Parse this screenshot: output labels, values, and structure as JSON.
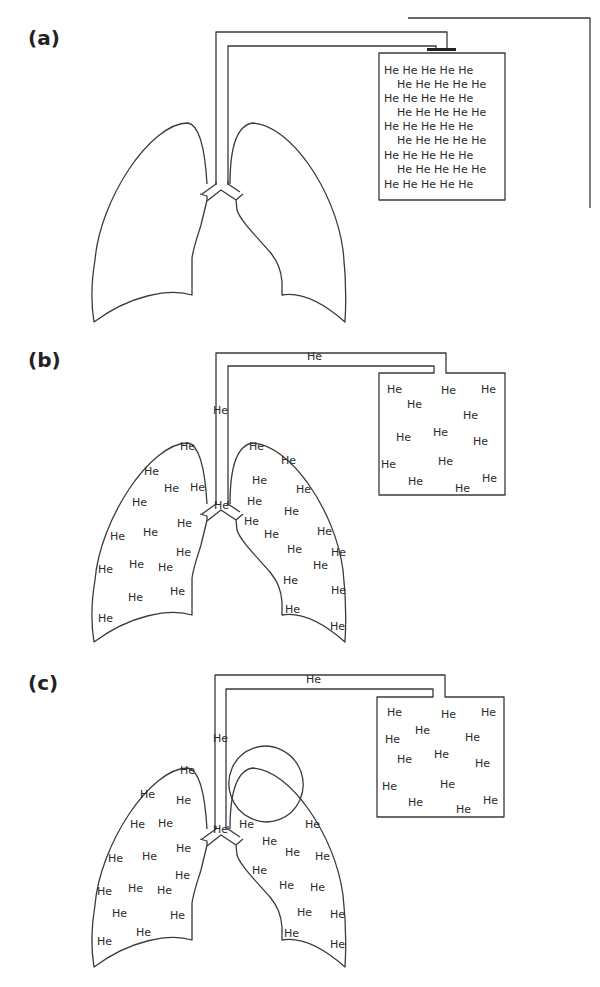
{
  "figure": {
    "panels": [
      {
        "id": "a",
        "label": "(a)",
        "valve": "closed",
        "tube_label": "",
        "trachea_label": "",
        "container_rows": [
          "He He He He He",
          "He He He He He",
          "He He He He He",
          "He He He He He",
          "He He He He He",
          "He He He He He",
          "He He He He He",
          "He He He He He",
          "He He He He He"
        ],
        "lung_atoms": "none"
      },
      {
        "id": "b",
        "label": "(b)",
        "valve": "open",
        "tube_label": "He",
        "trachea_label": "He",
        "junction_label": "He",
        "container_atoms": 14,
        "left_lung_atoms": 16,
        "right_lung_atoms": 18
      },
      {
        "id": "c",
        "label": "(c)",
        "valve": "open",
        "tube_label": "He",
        "trachea_label": "He",
        "junction_label": "He",
        "container_atoms": 15,
        "left_lung_atoms": 17,
        "right_lung_atoms": 13,
        "note": "Non-ventilated bulla (empty ellipse) in right upper lung"
      }
    ],
    "atom_text": "He"
  }
}
